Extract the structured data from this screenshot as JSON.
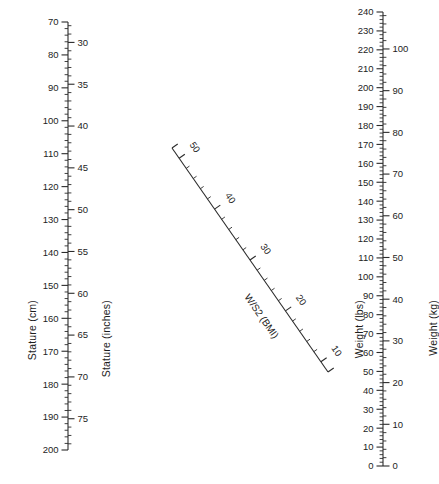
{
  "chart_data": {
    "type": "nomogram",
    "grid": false,
    "legend": "none",
    "axes": [
      {
        "name": "stature-cm",
        "label": "Stature (cm)",
        "units": "cm",
        "orientation": "vertical-left",
        "side": "left",
        "range": [
          70,
          200
        ],
        "direction": "top-to-bottom-increasing",
        "major_step": 10,
        "minor_step": 2,
        "tick_labels": [
          70,
          80,
          90,
          100,
          110,
          120,
          130,
          140,
          150,
          160,
          170,
          180,
          190,
          200
        ]
      },
      {
        "name": "stature-inches",
        "label": "Stature (inches)",
        "units": "inches",
        "orientation": "vertical-left",
        "side": "right",
        "range": [
          27.5,
          78.7
        ],
        "direction": "top-to-bottom-increasing",
        "major_step": 5,
        "minor_step": 1,
        "tick_labels": [
          30,
          35,
          40,
          45,
          50,
          55,
          60,
          65,
          70,
          75
        ]
      },
      {
        "name": "bmi-diagonal",
        "label": "W/S2 (BMI)",
        "units": "kg/m2",
        "orientation": "diagonal",
        "range": [
          8,
          52
        ],
        "direction": "upper-left-high-to-lower-right-low",
        "major_step": 10,
        "minor_step": 2,
        "tick_labels": [
          50,
          40,
          30,
          20,
          10
        ]
      },
      {
        "name": "weight-lbs",
        "label": "Weight (lbs)",
        "units": "lbs",
        "orientation": "vertical-right",
        "side": "left",
        "range": [
          0,
          240
        ],
        "direction": "top-to-bottom-decreasing",
        "major_step": 10,
        "minor_step": 2,
        "tick_labels": [
          240,
          230,
          220,
          210,
          200,
          190,
          180,
          170,
          160,
          150,
          140,
          130,
          120,
          110,
          100,
          90,
          80,
          70,
          60,
          50,
          40,
          30,
          20,
          10,
          0
        ]
      },
      {
        "name": "weight-kg",
        "label": "Weight (kg)",
        "units": "kg",
        "orientation": "vertical-right",
        "side": "right",
        "range": [
          0,
          110
        ],
        "direction": "top-to-bottom-decreasing",
        "major_step": 10,
        "minor_step": 2,
        "tick_labels": [
          110,
          100,
          90,
          80,
          70,
          60,
          50,
          40,
          30,
          20,
          10,
          0
        ]
      }
    ],
    "colors": {
      "ink": "#2b2b2b",
      "background": "#ffffff"
    }
  },
  "titles": {
    "stature_cm": "Stature (cm)",
    "stature_inches": "Stature (inches)",
    "weight_lbs": "Weight (lbs)",
    "weight_kg": "Weight (kg)",
    "bmi": "W/S2 (BMI)"
  }
}
